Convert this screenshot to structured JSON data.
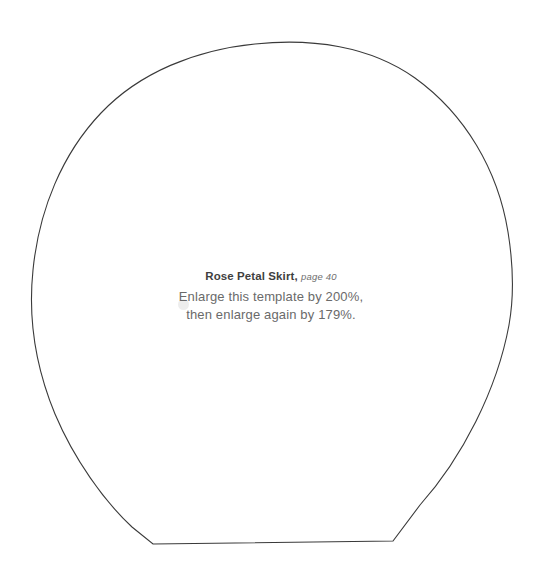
{
  "page": {
    "width": 542,
    "height": 573,
    "background_color": "#ffffff"
  },
  "pattern": {
    "name": "rose-petal-skirt-template",
    "outline_color": "#3a3a3a",
    "fill": "none",
    "stroke_width": 1.1,
    "description": "Large dome shaped sewing pattern piece with flat bottom edge",
    "geometry": {
      "apex": [
        255,
        44
      ],
      "leftmost": [
        32,
        300
      ],
      "rightmost": [
        512,
        290
      ],
      "bottom_left_corner": [
        153,
        544
      ],
      "bottom_right_corner": [
        393,
        541
      ]
    }
  },
  "caption": {
    "title_name": "Rose Petal Skirt,",
    "title_page": "page 40",
    "line1": "Enlarge this template by 200%,",
    "line2": "then enlarge again by 179%.",
    "text_color": "#6a6a6a",
    "title_color": "#3f3f3f"
  },
  "artifacts": {
    "smudge_color": "#ebebeb",
    "smudge_label": "faint-gray-dot"
  }
}
